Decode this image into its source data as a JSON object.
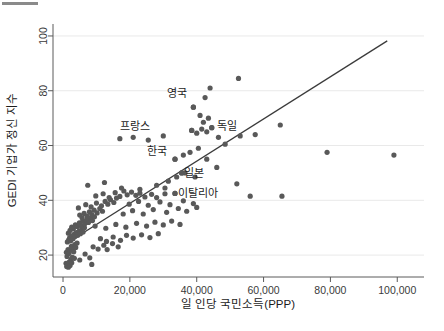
{
  "chart_data": {
    "type": "scatter",
    "title": "",
    "xlabel": "일 인당 국민소득(PPP)",
    "ylabel": "GEDI 기업가 정신 지수",
    "xlim": [
      -3000,
      108000
    ],
    "ylim": [
      12,
      104
    ],
    "grid": true,
    "legend": "none",
    "xticks": [
      0,
      20000,
      40000,
      60000,
      80000,
      100000
    ],
    "xtick_labels": [
      "0",
      "20,000",
      "40,000",
      "60,000",
      "80,000",
      "100,000"
    ],
    "yticks": [
      20,
      40,
      60,
      80,
      100
    ],
    "ytick_labels": [
      "20",
      "40",
      "60",
      "80",
      "100"
    ],
    "trendline": {
      "type": "linear",
      "x_start": 3000,
      "y_start": 25.8,
      "x_end": 97000,
      "y_end": 98.2
    },
    "annotations": [
      {
        "label": "영국",
        "x": 39000,
        "y": 74.0,
        "label_dx": -2000,
        "label_dy": 5.0
      },
      {
        "label": "프랑스",
        "x": 38500,
        "y": 65.5,
        "label_dx": -12500,
        "label_dy": 1.5
      },
      {
        "label": "독일",
        "x": 44500,
        "y": 66.5,
        "label_dx": 1500,
        "label_dy": 0.5
      },
      {
        "label": "한국",
        "x": 33500,
        "y": 55.0,
        "label_dx": -2500,
        "label_dy": 3.0
      },
      {
        "label": "일본",
        "x": 35500,
        "y": 50.0,
        "label_dx": 600,
        "label_dy": 0.0
      },
      {
        "label": "이탈리아",
        "x": 33500,
        "y": 42.5,
        "label_dx": 900,
        "label_dy": 0.0
      }
    ],
    "points": [
      [
        900,
        17.0
      ],
      [
        1100,
        15.8
      ],
      [
        1400,
        16.8
      ],
      [
        1600,
        15.6
      ],
      [
        1900,
        17.5
      ],
      [
        2100,
        16.2
      ],
      [
        2400,
        18.4
      ],
      [
        2600,
        17.2
      ],
      [
        1200,
        19.5
      ],
      [
        2800,
        19.2
      ],
      [
        1000,
        21.0
      ],
      [
        1500,
        22.0
      ],
      [
        1800,
        20.6
      ],
      [
        2200,
        21.8
      ],
      [
        2500,
        23.2
      ],
      [
        2900,
        22.4
      ],
      [
        3200,
        21.2
      ],
      [
        3500,
        23.8
      ],
      [
        3800,
        22.8
      ],
      [
        4200,
        24.4
      ],
      [
        1300,
        24.8
      ],
      [
        1700,
        25.6
      ],
      [
        2000,
        26.4
      ],
      [
        2300,
        25.2
      ],
      [
        2700,
        27.0
      ],
      [
        3000,
        26.0
      ],
      [
        3300,
        27.6
      ],
      [
        3600,
        26.8
      ],
      [
        4000,
        28.2
      ],
      [
        4400,
        27.2
      ],
      [
        4800,
        28.8
      ],
      [
        5200,
        27.8
      ],
      [
        5600,
        29.4
      ],
      [
        6000,
        28.4
      ],
      [
        6400,
        30.0
      ],
      [
        1600,
        28.0
      ],
      [
        2100,
        29.0
      ],
      [
        2600,
        30.2
      ],
      [
        3100,
        29.6
      ],
      [
        3700,
        31.0
      ],
      [
        4300,
        30.4
      ],
      [
        4900,
        31.8
      ],
      [
        5400,
        30.8
      ],
      [
        5900,
        32.4
      ],
      [
        6500,
        31.4
      ],
      [
        7000,
        32.8
      ],
      [
        7600,
        31.9
      ],
      [
        8200,
        33.4
      ],
      [
        8800,
        32.6
      ],
      [
        9400,
        34.0
      ],
      [
        5000,
        34.6
      ],
      [
        5700,
        33.6
      ],
      [
        6300,
        35.2
      ],
      [
        7200,
        34.2
      ],
      [
        7900,
        35.8
      ],
      [
        8600,
        34.8
      ],
      [
        9300,
        36.4
      ],
      [
        10200,
        35.4
      ],
      [
        11000,
        37.0
      ],
      [
        11800,
        36.0
      ],
      [
        4600,
        37.2
      ],
      [
        6800,
        38.4
      ],
      [
        8400,
        37.6
      ],
      [
        10000,
        39.0
      ],
      [
        11500,
        38.0
      ],
      [
        12600,
        39.6
      ],
      [
        13400,
        38.6
      ],
      [
        14200,
        40.2
      ],
      [
        15200,
        39.2
      ],
      [
        16000,
        40.8
      ],
      [
        9800,
        41.6
      ],
      [
        12000,
        42.4
      ],
      [
        13800,
        41.0
      ],
      [
        15600,
        42.8
      ],
      [
        17000,
        41.4
      ],
      [
        18200,
        43.4
      ],
      [
        19200,
        42.0
      ],
      [
        20500,
        43.0
      ],
      [
        21800,
        41.8
      ],
      [
        23000,
        42.6
      ],
      [
        7400,
        45.5
      ],
      [
        12400,
        46.5
      ],
      [
        17500,
        44.5
      ],
      [
        24500,
        41.2
      ],
      [
        26500,
        42.2
      ],
      [
        28000,
        41.0
      ],
      [
        30500,
        42.4
      ],
      [
        33500,
        42.5
      ],
      [
        6600,
        20.4
      ],
      [
        8000,
        19.0
      ],
      [
        9000,
        23.0
      ],
      [
        10500,
        22.2
      ],
      [
        12200,
        23.6
      ],
      [
        13200,
        22.0
      ],
      [
        14800,
        24.2
      ],
      [
        16500,
        23.0
      ],
      [
        11200,
        26.0
      ],
      [
        13000,
        25.0
      ],
      [
        15000,
        26.6
      ],
      [
        17200,
        25.4
      ],
      [
        19000,
        27.2
      ],
      [
        21000,
        26.2
      ],
      [
        23500,
        27.4
      ],
      [
        26000,
        26.4
      ],
      [
        28500,
        27.8
      ],
      [
        9600,
        30.6
      ],
      [
        12800,
        29.8
      ],
      [
        15800,
        31.2
      ],
      [
        18800,
        30.2
      ],
      [
        22000,
        31.6
      ],
      [
        25000,
        30.6
      ],
      [
        27500,
        32.0
      ],
      [
        30000,
        31.0
      ],
      [
        32500,
        32.4
      ],
      [
        35000,
        31.2
      ],
      [
        18000,
        35.0
      ],
      [
        20800,
        36.2
      ],
      [
        24000,
        35.0
      ],
      [
        27000,
        36.6
      ],
      [
        31000,
        35.6
      ],
      [
        34500,
        37.0
      ],
      [
        37000,
        36.0
      ],
      [
        40000,
        37.4
      ],
      [
        19800,
        38.6
      ],
      [
        22600,
        39.6
      ],
      [
        25500,
        38.2
      ],
      [
        29000,
        39.4
      ],
      [
        32000,
        38.4
      ],
      [
        36000,
        39.8
      ],
      [
        39000,
        38.8
      ],
      [
        8600,
        16.6
      ],
      [
        5000,
        18.2
      ],
      [
        3400,
        18.8
      ],
      [
        31500,
        47.0
      ],
      [
        34000,
        48.5
      ],
      [
        36500,
        50.0
      ],
      [
        35500,
        50.0
      ],
      [
        33500,
        55.0
      ],
      [
        36000,
        56.5
      ],
      [
        38000,
        57.5
      ],
      [
        40500,
        59.0
      ],
      [
        30000,
        63.5
      ],
      [
        25500,
        62.0
      ],
      [
        21000,
        63.0
      ],
      [
        17000,
        62.5
      ],
      [
        38500,
        65.5
      ],
      [
        40000,
        64.5
      ],
      [
        41500,
        66.0
      ],
      [
        43000,
        65.0
      ],
      [
        44500,
        66.5
      ],
      [
        42000,
        68.5
      ],
      [
        43500,
        70.0
      ],
      [
        39000,
        74.0
      ],
      [
        41000,
        71.0
      ],
      [
        42500,
        77.5
      ],
      [
        44000,
        81.0
      ],
      [
        52500,
        84.5
      ],
      [
        46500,
        63.0
      ],
      [
        48500,
        60.5
      ],
      [
        53000,
        63.5
      ],
      [
        57500,
        64.0
      ],
      [
        65000,
        67.5
      ],
      [
        52000,
        46.0
      ],
      [
        56000,
        41.5
      ],
      [
        65500,
        41.5
      ],
      [
        79000,
        57.5
      ],
      [
        99000,
        56.5
      ],
      [
        43000,
        55.0
      ],
      [
        46000,
        52.0
      ],
      [
        39500,
        48.5
      ],
      [
        30500,
        44.5
      ],
      [
        28000,
        45.5
      ],
      [
        23000,
        44.0
      ]
    ]
  }
}
